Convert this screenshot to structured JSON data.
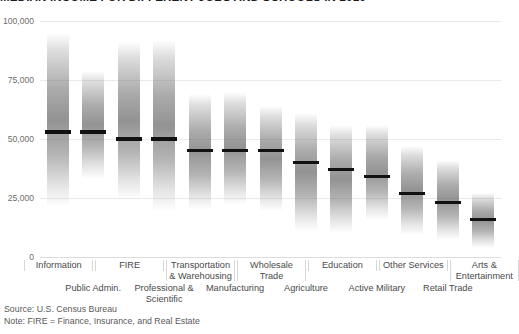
{
  "title": "MEDIAN INCOME FOR DIFFERENT JOBS AND SCHOOLS IN 2016",
  "footnotes": {
    "source": "Source: U.S. Census Bureau",
    "note": "Note: FIRE = Finance, Insurance, and Real Estate"
  },
  "chart_data": {
    "type": "bar",
    "title": "MEDIAN INCOME FOR DIFFERENT JOBS AND SCHOOLS IN 2016",
    "xlabel": "",
    "ylabel": "",
    "ylim": [
      0,
      100000
    ],
    "yticks": [
      0,
      25000,
      50000,
      75000,
      100000
    ],
    "ytick_labels": [
      "0",
      "25,000",
      "50,000",
      "75,000",
      "100,000"
    ],
    "grid": true,
    "legend": "none",
    "value_key": "median",
    "range_keys": [
      "low",
      "high"
    ],
    "categories": [
      "Information",
      "Public Admin.",
      "FIRE",
      "Professional & Scientific",
      "Transportation & Warehousing",
      "Manufacturing",
      "Wholesale Trade",
      "Agriculture",
      "Education",
      "Active Military",
      "Other Services",
      "Retail Trade",
      "Arts & Entertainment"
    ],
    "values": [
      53000,
      53000,
      50000,
      50000,
      45000,
      45000,
      45000,
      40000,
      37000,
      34000,
      27000,
      23000,
      16000
    ],
    "series": [
      {
        "name": "Median income",
        "values": [
          53000,
          53000,
          50000,
          50000,
          45000,
          45000,
          45000,
          40000,
          37000,
          34000,
          27000,
          23000,
          16000
        ]
      },
      {
        "name": "Income distribution range (low)",
        "values": [
          21000,
          33000,
          24000,
          19500,
          20000,
          22000,
          19500,
          11000,
          10000,
          15500,
          9500,
          7000,
          4000
        ]
      },
      {
        "name": "Income distribution range (high)",
        "values": [
          95000,
          79000,
          91000,
          92000,
          69000,
          70000,
          64000,
          61000,
          56000,
          56000,
          47000,
          41000,
          27000
        ]
      }
    ],
    "bars": [
      {
        "label": "Information",
        "median": 53000,
        "low": 21000,
        "high": 95000
      },
      {
        "label": "Public Admin.",
        "median": 53000,
        "low": 33000,
        "high": 79000
      },
      {
        "label": "FIRE",
        "median": 50000,
        "low": 24000,
        "high": 91000
      },
      {
        "label": "Professional & Scientific",
        "median": 50000,
        "low": 19500,
        "high": 92000
      },
      {
        "label": "Transportation & Warehousing",
        "median": 45000,
        "low": 20000,
        "high": 69000
      },
      {
        "label": "Manufacturing",
        "median": 45000,
        "low": 22000,
        "high": 70000
      },
      {
        "label": "Wholesale Trade",
        "median": 45000,
        "low": 19500,
        "high": 64000
      },
      {
        "label": "Agriculture",
        "median": 40000,
        "low": 11000,
        "high": 61000
      },
      {
        "label": "Education",
        "median": 37000,
        "low": 10000,
        "high": 56000
      },
      {
        "label": "Active Military",
        "median": 34000,
        "low": 15500,
        "high": 56000
      },
      {
        "label": "Other Services",
        "median": 27000,
        "low": 9500,
        "high": 47000
      },
      {
        "label": "Retail Trade",
        "median": 23000,
        "low": 7000,
        "high": 41000
      },
      {
        "label": "Arts & Entertainment",
        "median": 16000,
        "low": 4000,
        "high": 27000
      }
    ],
    "axis_labels_row1": [
      {
        "label": "Information",
        "index": 0
      },
      {
        "label": "FIRE",
        "index": 2
      },
      {
        "label": "Transportation & Warehousing",
        "index": 4
      },
      {
        "label": "Wholesale Trade",
        "index": 6
      },
      {
        "label": "Education",
        "index": 8
      },
      {
        "label": "Other Services",
        "index": 10
      },
      {
        "label": "Arts & Entertainment",
        "index": 12
      }
    ],
    "axis_labels_row2": [
      {
        "label": "Public Admin.",
        "index": 1
      },
      {
        "label": "Professional & Scientific",
        "index": 3
      },
      {
        "label": "Manufacturing",
        "index": 5
      },
      {
        "label": "Agriculture",
        "index": 7
      },
      {
        "label": "Active Military",
        "index": 9
      },
      {
        "label": "Retail Trade",
        "index": 11
      }
    ],
    "colors": {
      "median_line": "#111111",
      "bar_gradient": "#787878",
      "gridline": "#e9e9e9",
      "text": "#4a4a4a",
      "title": "#1a1a1a"
    }
  }
}
